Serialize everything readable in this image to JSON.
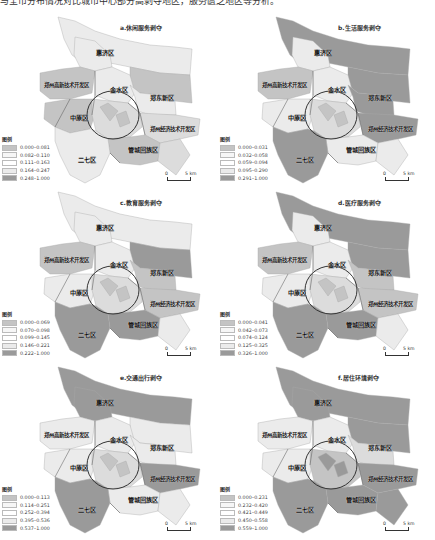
{
  "caption": "与全市分布情况对比城市中心部分高剥夺地区，服务匮乏地区等分析。",
  "legend_title": "图例",
  "scale_unit": "5 km",
  "scale_zero": "0",
  "colors": {
    "dark": "#9a9a9a",
    "mid_dark": "#c4c4c4",
    "mid": "#dcdcdc",
    "light": "#ebebeb",
    "lightest": "#f6f6f6",
    "boundary": "#555555",
    "ring": "#333333"
  },
  "districts": {
    "huiji": "惠济区",
    "gaoxin": "郑州高新技术开发区",
    "jinshui": "金水区",
    "zhengdong": "郑东新区",
    "zhongyuan": "中原区",
    "jingkai": "郑州经济技术开发区",
    "erqi": "二七区",
    "guancheng": "管城回族区"
  },
  "panels": [
    {
      "id": "a",
      "title": "a.休闲服务剥夺",
      "legend": [
        "0.000–0.081",
        "0.082–0.110",
        "0.111–0.163",
        "0.164–0.247",
        "0.248–1.000"
      ]
    },
    {
      "id": "b",
      "title": "b.生活服务剥夺",
      "legend": [
        "0.000–0.031",
        "0.032–0.058",
        "0.059–0.094",
        "0.095–0.290",
        "0.291–1.000"
      ]
    },
    {
      "id": "c",
      "title": "c.教育服务剥夺",
      "legend": [
        "0.000–0.069",
        "0.070–0.098",
        "0.099–0.145",
        "0.146–0.221",
        "0.222–1.000"
      ]
    },
    {
      "id": "d",
      "title": "d.医疗服务剥夺",
      "legend": [
        "0.000–0.041",
        "0.042–0.073",
        "0.074–0.124",
        "0.125–0.325",
        "0.326–1.000"
      ]
    },
    {
      "id": "e",
      "title": "e.交通出行剥夺",
      "legend": [
        "0.000–0.113",
        "0.114–0.251",
        "0.252–0.394",
        "0.395–0.536",
        "0.537–1.000"
      ]
    },
    {
      "id": "f",
      "title": "f.居住环境剥夺",
      "legend": [
        "0.000–0.231",
        "0.232–0.420",
        "0.421–0.449",
        "0.450–0.558",
        "0.559–1.000"
      ]
    }
  ]
}
